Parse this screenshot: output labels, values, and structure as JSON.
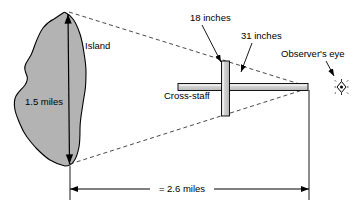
{
  "figure": {
    "type": "geometry-diagram"
  },
  "labels": {
    "island": "Island",
    "island_height": "1.5 miles",
    "cross_piece": "18 inches",
    "staff_length": "31 inches",
    "observer_eye": "Observer's eye",
    "cross_staff": "Cross-staff",
    "baseline_distance": "= 2.6 miles"
  },
  "colors": {
    "island_fill": "#b3b3b3",
    "island_stroke": "#000000",
    "staff_fill": "#c9c9c9",
    "staff_highlight": "#e8e8e8",
    "staff_stroke": "#000000",
    "line": "#000000",
    "dashed": "#444444",
    "background": "#ffffff"
  },
  "measurements": {
    "island_height_value": 1.5,
    "island_height_unit": "miles",
    "cross_piece_value": 18,
    "cross_piece_unit": "inches",
    "staff_value": 31,
    "staff_unit": "inches",
    "baseline_value": 2.6,
    "baseline_unit": "miles"
  },
  "icons": {
    "eye": "eye-icon"
  }
}
